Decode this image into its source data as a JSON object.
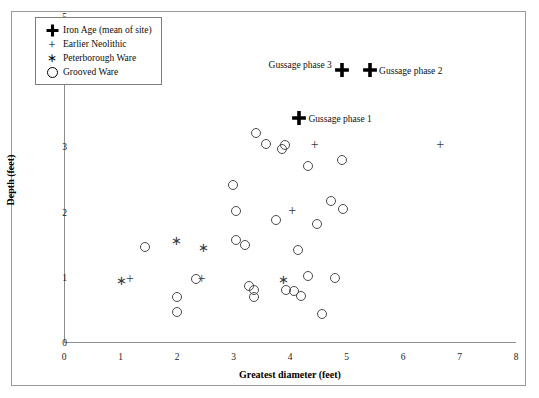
{
  "chart_data": {
    "type": "scatter",
    "title": "",
    "xlabel": "Greatest diameter (feet)",
    "ylabel": "Depth (feet)",
    "xlim": [
      0,
      8
    ],
    "ylim": [
      0,
      5
    ],
    "xticks": [
      0,
      1,
      2,
      3,
      4,
      5,
      6,
      7,
      8
    ],
    "yticks": [
      0,
      1,
      2,
      3,
      4,
      5
    ],
    "grid": false,
    "legend_position": "top-left",
    "series": [
      {
        "name": "Iron Age (mean of site)",
        "marker": "bold-cross",
        "points": [
          {
            "x": 4.15,
            "y": 3.45,
            "label": "Gussage phase 1"
          },
          {
            "x": 4.9,
            "y": 4.18,
            "label": "Gussage phase 3"
          },
          {
            "x": 5.4,
            "y": 4.18,
            "label": "Gussage phase 2"
          }
        ]
      },
      {
        "name": "Earlier Neolithic",
        "marker": "plus",
        "points": [
          {
            "x": 1.15,
            "y": 0.98
          },
          {
            "x": 2.42,
            "y": 0.98
          },
          {
            "x": 4.02,
            "y": 2.02
          },
          {
            "x": 4.42,
            "y": 3.03
          },
          {
            "x": 6.64,
            "y": 3.03
          }
        ]
      },
      {
        "name": "Peterborough Ware",
        "marker": "asterisk",
        "points": [
          {
            "x": 1.0,
            "y": 0.97
          },
          {
            "x": 1.98,
            "y": 1.58
          },
          {
            "x": 2.45,
            "y": 1.48
          },
          {
            "x": 3.86,
            "y": 0.98
          }
        ]
      },
      {
        "name": "Grooved Ware",
        "marker": "circle",
        "points": [
          {
            "x": 1.42,
            "y": 1.48
          },
          {
            "x": 1.98,
            "y": 0.7
          },
          {
            "x": 1.98,
            "y": 0.48
          },
          {
            "x": 2.32,
            "y": 0.98
          },
          {
            "x": 2.97,
            "y": 2.43
          },
          {
            "x": 3.03,
            "y": 2.02
          },
          {
            "x": 3.03,
            "y": 1.58
          },
          {
            "x": 3.18,
            "y": 1.5
          },
          {
            "x": 3.26,
            "y": 0.88
          },
          {
            "x": 3.35,
            "y": 0.82
          },
          {
            "x": 3.35,
            "y": 0.7
          },
          {
            "x": 3.38,
            "y": 3.22
          },
          {
            "x": 3.56,
            "y": 3.05
          },
          {
            "x": 3.74,
            "y": 1.88
          },
          {
            "x": 3.84,
            "y": 2.98
          },
          {
            "x": 3.9,
            "y": 3.04
          },
          {
            "x": 3.92,
            "y": 0.82
          },
          {
            "x": 4.06,
            "y": 0.8
          },
          {
            "x": 4.12,
            "y": 1.42
          },
          {
            "x": 4.18,
            "y": 0.72
          },
          {
            "x": 4.3,
            "y": 1.02
          },
          {
            "x": 4.3,
            "y": 2.72
          },
          {
            "x": 4.46,
            "y": 1.82
          },
          {
            "x": 4.54,
            "y": 0.45
          },
          {
            "x": 4.7,
            "y": 2.18
          },
          {
            "x": 4.78,
            "y": 1.0
          },
          {
            "x": 4.9,
            "y": 2.8
          },
          {
            "x": 4.92,
            "y": 2.05
          }
        ]
      }
    ]
  },
  "legend": {
    "items": [
      {
        "symbol": "bold-cross",
        "label": "Iron Age (mean of site)"
      },
      {
        "symbol": "plus",
        "label": "Earlier Neolithic"
      },
      {
        "symbol": "asterisk",
        "label": "Peterborough Ware"
      },
      {
        "symbol": "circle",
        "label": "Grooved Ware"
      }
    ]
  }
}
